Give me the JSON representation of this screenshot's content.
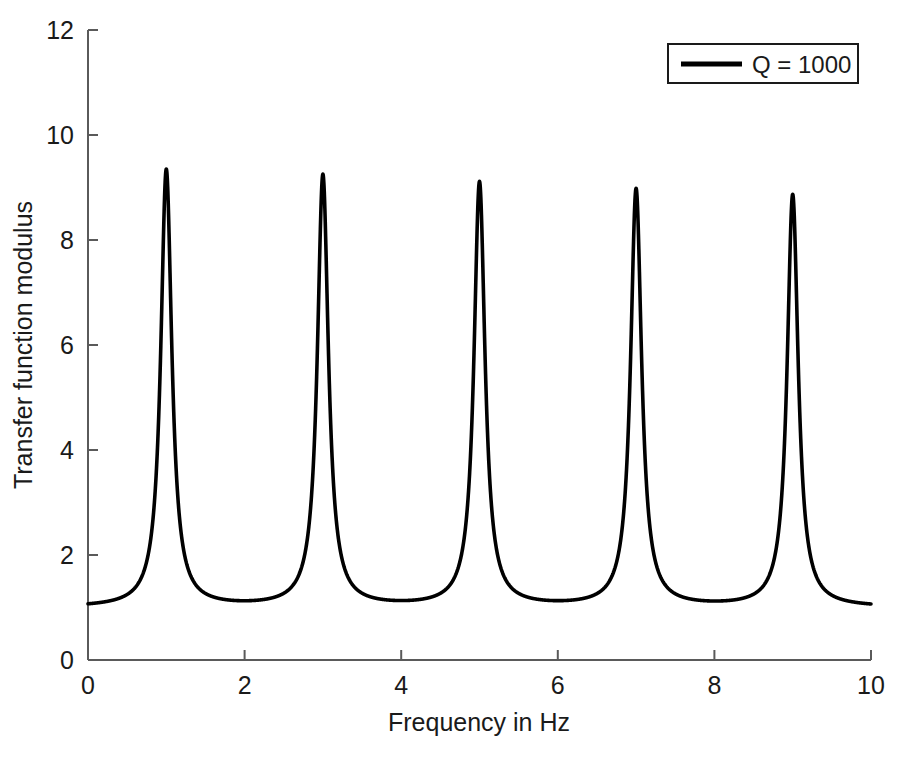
{
  "chart_data": {
    "type": "line",
    "title": "",
    "subtitle": "",
    "xlabel": "Frequency in Hz",
    "ylabel": "Transfer function modulus",
    "xlim": [
      0,
      10
    ],
    "ylim": [
      0,
      12
    ],
    "xticks": [
      0,
      2,
      4,
      6,
      8,
      10
    ],
    "yticks": [
      0,
      2,
      4,
      6,
      8,
      10,
      12
    ],
    "xtick_labels": [
      "0",
      "2",
      "4",
      "6",
      "8",
      "10"
    ],
    "ytick_labels": [
      "0",
      "2",
      "4",
      "6",
      "8",
      "10",
      "12"
    ],
    "grid": false,
    "legend_position": "top-right",
    "series": [
      {
        "name": "Q = 1000",
        "color": "#000000",
        "line_width": 3.5,
        "peaks": {
          "x": [
            1,
            3,
            5,
            7,
            9
          ],
          "y": [
            9.33,
            9.22,
            9.08,
            8.95,
            8.85
          ]
        },
        "troughs": {
          "x": [
            0,
            2,
            4,
            6,
            8,
            10
          ],
          "y": [
            1.0,
            1.0,
            1.0,
            1.0,
            1.0,
            1.05
          ]
        },
        "baseline": 1.0,
        "peak_half_width": 0.085,
        "x": [
          0,
          0.25,
          0.5,
          0.75,
          0.85,
          0.9,
          0.95,
          1,
          1.05,
          1.1,
          1.15,
          1.25,
          1.5,
          1.75,
          2,
          2.25,
          2.5,
          2.75,
          2.85,
          2.9,
          2.95,
          3,
          3.05,
          3.1,
          3.15,
          3.25,
          3.5,
          3.75,
          4,
          4.25,
          4.5,
          4.75,
          4.85,
          4.9,
          4.95,
          5,
          5.05,
          5.1,
          5.15,
          5.25,
          5.5,
          5.75,
          6,
          6.25,
          6.5,
          6.75,
          6.85,
          6.9,
          6.95,
          7,
          7.05,
          7.1,
          7.15,
          7.25,
          7.5,
          7.75,
          8,
          8.25,
          8.5,
          8.75,
          8.85,
          8.9,
          8.95,
          9,
          9.05,
          9.1,
          9.15,
          9.25,
          9.5,
          9.75,
          10
        ],
        "y": [
          1.0,
          1.04,
          1.18,
          1.72,
          2.35,
          3.1,
          5.4,
          9.33,
          5.4,
          3.1,
          2.35,
          1.72,
          1.18,
          1.04,
          1.0,
          1.04,
          1.18,
          1.72,
          2.34,
          3.08,
          5.35,
          9.22,
          5.35,
          3.08,
          2.34,
          1.72,
          1.18,
          1.04,
          1.0,
          1.04,
          1.18,
          1.71,
          2.33,
          3.05,
          5.28,
          9.08,
          5.28,
          3.05,
          2.33,
          1.71,
          1.18,
          1.04,
          1.0,
          1.04,
          1.18,
          1.71,
          2.32,
          3.03,
          5.22,
          8.95,
          5.22,
          3.03,
          2.32,
          1.71,
          1.18,
          1.04,
          1.0,
          1.04,
          1.18,
          1.7,
          2.31,
          3.01,
          5.17,
          8.85,
          5.17,
          3.01,
          2.31,
          1.7,
          1.18,
          1.05,
          1.05
        ]
      }
    ]
  },
  "legend": {
    "entries": [
      {
        "label": "Q = 1000",
        "color": "#000000"
      }
    ]
  },
  "axes": {
    "xlabel": "Frequency in Hz",
    "ylabel": "Transfer function modulus"
  }
}
